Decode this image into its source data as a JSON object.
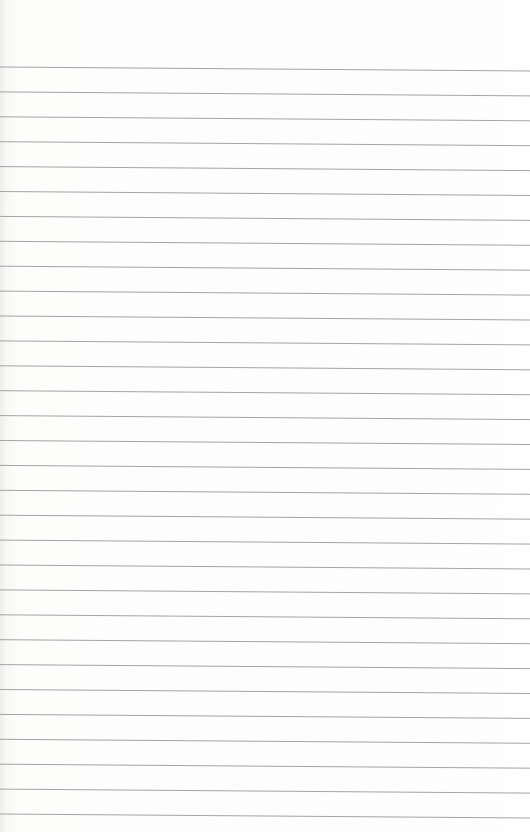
{
  "page": {
    "type": "blank lined paper",
    "background_color": "#fdfdfc",
    "line_color": "#9a9a9a",
    "line_count": 31,
    "first_line_y": 69,
    "line_spacing": 24.9,
    "tilt_px": 4
  }
}
